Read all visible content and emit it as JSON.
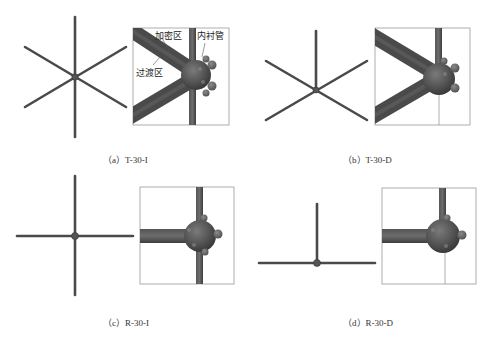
{
  "figure": {
    "panels": [
      {
        "id": "a",
        "caption": "（a）T-30-I",
        "type": "triangular-grid",
        "joint": "interior",
        "labels": [
          "加密区",
          "过渡区",
          "内衬管"
        ]
      },
      {
        "id": "b",
        "caption": "（b）T-30-D",
        "type": "triangular-grid",
        "joint": "boundary"
      },
      {
        "id": "c",
        "caption": "（c）R-30-I",
        "type": "rectangular-grid",
        "joint": "interior"
      },
      {
        "id": "d",
        "caption": "（d）R-30-D",
        "type": "rectangular-grid",
        "joint": "boundary"
      }
    ],
    "annotations": {
      "densified_zone": "加密区",
      "transition_zone": "过渡区",
      "liner_tube": "内衬管"
    },
    "colors": {
      "member": "#4a4a4a",
      "member_highlight": "#6a6a6a",
      "node": "#555555",
      "box_border": "#9a9a9a",
      "background": "#ffffff"
    }
  }
}
